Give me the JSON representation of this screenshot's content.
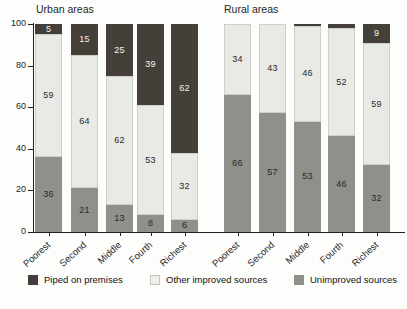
{
  "groups": [
    {
      "key": "urban",
      "title": "Urban areas"
    },
    {
      "key": "rural",
      "title": "Rural areas"
    }
  ],
  "legend": [
    {
      "key": "piped",
      "label": "Piped on premises",
      "color": "#453f3a"
    },
    {
      "key": "other",
      "label": "Other improved sources",
      "color": "#e9e9e6"
    },
    {
      "key": "unimp",
      "label": "Unimproved sources",
      "color": "#8f8f8b"
    }
  ],
  "yaxis": {
    "ticks": [
      "0",
      "20",
      "40",
      "60",
      "80",
      "100"
    ],
    "min": 0,
    "max": 100
  },
  "xlabels": [
    "Poorest",
    "Second",
    "Middle",
    "Fourth",
    "Richest",
    "Poorest",
    "Second",
    "Middle",
    "Fourth",
    "Richest"
  ],
  "chart_data": {
    "type": "bar",
    "title": "",
    "xlabel": "",
    "ylabel": "",
    "ylim": [
      0,
      100
    ],
    "grid": false,
    "stacked": true,
    "legend_position": "bottom",
    "categories": [
      "Poorest",
      "Second",
      "Middle",
      "Fourth",
      "Richest",
      "Poorest",
      "Second",
      "Middle",
      "Fourth",
      "Richest"
    ],
    "groups": [
      "Urban areas",
      "Urban areas",
      "Urban areas",
      "Urban areas",
      "Urban areas",
      "Rural areas",
      "Rural areas",
      "Rural areas",
      "Rural areas",
      "Rural areas"
    ],
    "series": [
      {
        "name": "Unimproved sources",
        "values": [
          36,
          21,
          13,
          8,
          6,
          66,
          57,
          53,
          46,
          32
        ]
      },
      {
        "name": "Other improved sources",
        "values": [
          59,
          64,
          62,
          53,
          32,
          34,
          43,
          46,
          52,
          59
        ]
      },
      {
        "name": "Piped on premises",
        "values": [
          5,
          15,
          25,
          39,
          62,
          0,
          0,
          1,
          2,
          9
        ]
      }
    ],
    "bar_labels": {
      "unimproved": [
        "36",
        "21",
        "13",
        "8",
        "6",
        "66",
        "57",
        "53",
        "46",
        "32"
      ],
      "other_improved": [
        "59",
        "64",
        "62",
        "53",
        "32",
        "34",
        "43",
        "46",
        "52",
        "59"
      ],
      "piped": [
        "5",
        "15",
        "25",
        "39",
        "62",
        "",
        "",
        "",
        "",
        "9"
      ]
    }
  },
  "bars": [
    {
      "group": "urban",
      "cat": "Poorest",
      "unimp": 36,
      "other": 59,
      "piped": 5,
      "unimp_label": "36",
      "other_label": "59",
      "piped_label": "5"
    },
    {
      "group": "urban",
      "cat": "Second",
      "unimp": 21,
      "other": 64,
      "piped": 15,
      "unimp_label": "21",
      "other_label": "64",
      "piped_label": "15"
    },
    {
      "group": "urban",
      "cat": "Middle",
      "unimp": 13,
      "other": 62,
      "piped": 25,
      "unimp_label": "13",
      "other_label": "62",
      "piped_label": "25"
    },
    {
      "group": "urban",
      "cat": "Fourth",
      "unimp": 8,
      "other": 53,
      "piped": 39,
      "unimp_label": "8",
      "other_label": "53",
      "piped_label": "39"
    },
    {
      "group": "urban",
      "cat": "Richest",
      "unimp": 6,
      "other": 32,
      "piped": 62,
      "unimp_label": "6",
      "other_label": "32",
      "piped_label": "62"
    },
    {
      "group": "rural",
      "cat": "Poorest",
      "unimp": 66,
      "other": 34,
      "piped": 0,
      "unimp_label": "66",
      "other_label": "34",
      "piped_label": ""
    },
    {
      "group": "rural",
      "cat": "Second",
      "unimp": 57,
      "other": 43,
      "piped": 0,
      "unimp_label": "57",
      "other_label": "43",
      "piped_label": ""
    },
    {
      "group": "rural",
      "cat": "Middle",
      "unimp": 53,
      "other": 46,
      "piped": 1,
      "unimp_label": "53",
      "other_label": "46",
      "piped_label": ""
    },
    {
      "group": "rural",
      "cat": "Fourth",
      "unimp": 46,
      "other": 52,
      "piped": 2,
      "unimp_label": "46",
      "other_label": "52",
      "piped_label": ""
    },
    {
      "group": "rural",
      "cat": "Richest",
      "unimp": 32,
      "other": 59,
      "piped": 9,
      "unimp_label": "32",
      "other_label": "59",
      "piped_label": "9"
    }
  ]
}
